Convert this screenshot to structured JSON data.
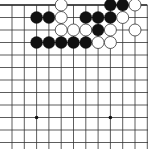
{
  "board": {
    "size": 19,
    "visible_cols": [
      1,
      2,
      3,
      4,
      5,
      6,
      7,
      8,
      9,
      10,
      11,
      12
    ],
    "visible_rows": [
      0,
      1,
      2,
      3,
      4,
      5,
      6,
      7,
      8,
      9,
      10,
      11
    ],
    "origin_x": 12,
    "origin_y": 5,
    "spacing_x": 12.3,
    "spacing_y": 12.5,
    "line_color": "#333333",
    "edge_color": "#111111",
    "background": "#ffffff",
    "star_points": [
      {
        "col": 3,
        "row": 3
      },
      {
        "col": 9,
        "row": 3
      },
      {
        "col": 3,
        "row": 9
      },
      {
        "col": 9,
        "row": 9
      }
    ],
    "stones": [
      {
        "color": "white",
        "col": 5,
        "row": 0
      },
      {
        "color": "black",
        "col": 9,
        "row": 0
      },
      {
        "color": "black",
        "col": 10,
        "row": 0
      },
      {
        "color": "white",
        "col": 11,
        "row": 0
      },
      {
        "color": "black",
        "col": 3,
        "row": 1
      },
      {
        "color": "black",
        "col": 4,
        "row": 1
      },
      {
        "color": "white",
        "col": 5,
        "row": 1
      },
      {
        "color": "black",
        "col": 7,
        "row": 1
      },
      {
        "color": "black",
        "col": 8,
        "row": 1
      },
      {
        "color": "black",
        "col": 9,
        "row": 1
      },
      {
        "color": "white",
        "col": 10,
        "row": 1
      },
      {
        "color": "white",
        "col": 5,
        "row": 2
      },
      {
        "color": "white",
        "col": 6,
        "row": 2
      },
      {
        "color": "white",
        "col": 7,
        "row": 2
      },
      {
        "color": "black",
        "col": 8,
        "row": 2
      },
      {
        "color": "white",
        "col": 9,
        "row": 2
      },
      {
        "color": "white",
        "col": 11,
        "row": 2
      },
      {
        "color": "black",
        "col": 3,
        "row": 3
      },
      {
        "color": "black",
        "col": 4,
        "row": 3
      },
      {
        "color": "black",
        "col": 5,
        "row": 3
      },
      {
        "color": "black",
        "col": 6,
        "row": 3
      },
      {
        "color": "black",
        "col": 7,
        "row": 3
      },
      {
        "color": "white",
        "col": 8,
        "row": 3
      },
      {
        "color": "white",
        "col": 9,
        "row": 3
      }
    ]
  }
}
